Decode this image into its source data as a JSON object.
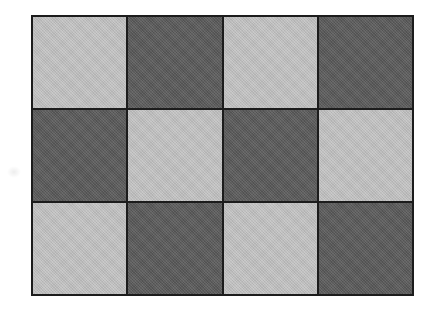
{
  "figure": {
    "background_color": "#ffffff"
  },
  "checkerboard": {
    "columns": 4,
    "rows": 3,
    "pattern": [
      [
        "light",
        "dark",
        "light",
        "dark"
      ],
      [
        "dark",
        "light",
        "dark",
        "light"
      ],
      [
        "light",
        "dark",
        "light",
        "dark"
      ]
    ],
    "colors": {
      "light": "#c3c3c3",
      "dark": "#595959",
      "line": "#1c1c1c"
    }
  }
}
